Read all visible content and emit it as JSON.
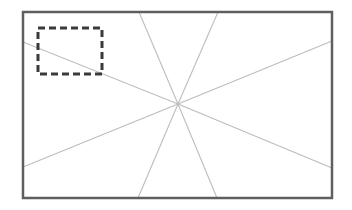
{
  "canvas": {
    "width": 352,
    "height": 210,
    "background": "#ffffff"
  },
  "frame": {
    "x": 23,
    "y": 12,
    "width": 309,
    "height": 186,
    "stroke": "#5f5f5f",
    "stroke_width": 2.5
  },
  "center": {
    "x": 178,
    "y": 104
  },
  "rays": {
    "stroke": "#bdbdbd",
    "stroke_width": 1.1,
    "endpoints": [
      {
        "name": "ray-top-left",
        "x": 139,
        "y": 12
      },
      {
        "name": "ray-top-right",
        "x": 218,
        "y": 12
      },
      {
        "name": "ray-right-top",
        "x": 332,
        "y": 41
      },
      {
        "name": "ray-right-bottom",
        "x": 332,
        "y": 168
      },
      {
        "name": "ray-bottom-right",
        "x": 217,
        "y": 198
      },
      {
        "name": "ray-bottom-left",
        "x": 138,
        "y": 198
      },
      {
        "name": "ray-left-bottom",
        "x": 23,
        "y": 167
      },
      {
        "name": "ray-left-top",
        "x": 23,
        "y": 42
      }
    ]
  },
  "selection": {
    "x": 38,
    "y": 28,
    "width": 64,
    "height": 46,
    "stroke": "#3a3a3a",
    "stroke_width": 3,
    "dash": "7 4"
  }
}
